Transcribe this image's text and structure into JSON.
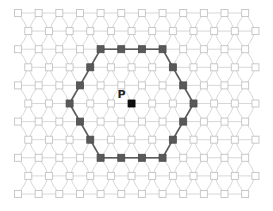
{
  "diagram": {
    "type": "triangular-lattice",
    "rows": 11,
    "nodes_per_row": 12,
    "origin": {
      "x": 18,
      "y": 13
    },
    "dx": 20.65,
    "dy": 18.1,
    "odd_row_offset": 10.3,
    "node_size": 7,
    "colors": {
      "edge": "#d2d2d2",
      "node_fill": "#ffffff",
      "node_stroke": "#c4c4c4",
      "hex_node": "#595959",
      "hex_edge": "#5a5a5a",
      "center_node": "#111111"
    },
    "center": {
      "label": "P",
      "row": 5,
      "col": 5
    },
    "hexagon_nodes": [
      [
        2,
        4
      ],
      [
        2,
        5
      ],
      [
        2,
        6
      ],
      [
        2,
        7
      ],
      [
        3,
        7
      ],
      [
        4,
        8
      ],
      [
        5,
        8
      ],
      [
        6,
        8
      ],
      [
        7,
        7
      ],
      [
        8,
        7
      ],
      [
        8,
        6
      ],
      [
        8,
        5
      ],
      [
        8,
        4
      ],
      [
        7,
        3
      ],
      [
        6,
        3
      ],
      [
        5,
        2
      ],
      [
        4,
        3
      ],
      [
        3,
        3
      ]
    ]
  }
}
